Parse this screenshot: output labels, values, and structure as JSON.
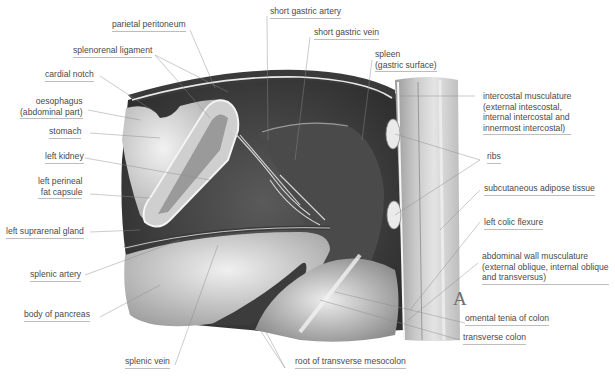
{
  "figure": {
    "panel_letter": "A",
    "labels": {
      "parietal_peritoneum": "parietal peritoneum",
      "splenorenal_ligament": "splenorenal ligament",
      "cardial_notch": "cardial notch",
      "oesophagus": "oesophagus\n(abdominal part)",
      "stomach": "stomach",
      "left_kidney": "left kidney",
      "left_perineal_fat_capsule": "left perineal\nfat capsule",
      "left_suprarenal_gland": "left suprarenal gland",
      "splenic_artery": "splenic artery",
      "body_of_pancreas": "body of pancreas",
      "splenic_vein": "splenic vein",
      "root_of_transverse_mesocolon": "root of transverse mesocolon",
      "short_gastric_artery": "short gastric artery",
      "short_gastric_vein": "short gastric vein",
      "spleen": "spleen\n(gastric surface)",
      "intercostal_musculature": "intercostal musculature\n(external intescostal,\ninternal intercostal and\ninnermost intercostal)",
      "ribs": "ribs",
      "subcutaneous_adipose_tissue": "subcutaneous adipose tissue",
      "left_colic_flexure": "left colic flexure",
      "abdominal_wall_musculature": "abdominal wall musculature\n(external oblique, internal oblique\nand transversus)",
      "omental_tenia_of_colon": "omental tenia of colon",
      "transverse_colon": "transverse colon"
    }
  }
}
